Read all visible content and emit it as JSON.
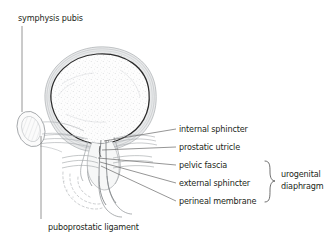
{
  "figure": {
    "background_color": "#ffffff",
    "ink_color": "#231f20",
    "wall_gray": "#9a9a9a",
    "light_gray": "#c8c8c8"
  },
  "labels": {
    "symphysis_pubis": "symphysis pubis",
    "puboprostatic_ligament": "puboprostatic ligament",
    "internal_sphincter": "internal sphincter",
    "prostatic_utricle": "prostatic utricle",
    "pelvic_fascia": "pelvic fascia",
    "external_sphincter": "external sphincter",
    "perineal_membrane": "perineal membrane",
    "urogenital": "urogenital",
    "diaphragm": "diaphragm"
  },
  "structures": {
    "bladder": "bladder",
    "prostate": "prostate",
    "urethra": "urethra",
    "symphysis_pubis_bone": "symphysis-pubis-bone",
    "pelvic_fascia_bands": "pelvic-fascia-bands",
    "perineal_membrane_bands": "perineal-membrane-bands",
    "dashed_arcs": "dashed-arcs"
  }
}
